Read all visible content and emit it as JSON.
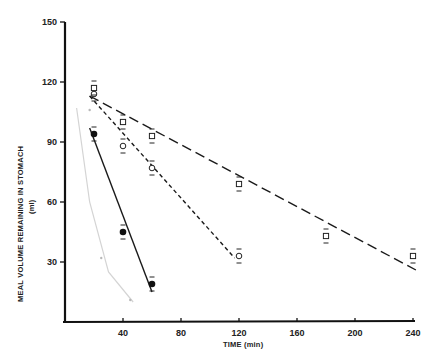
{
  "chart_data": {
    "type": "scatter",
    "title": "",
    "xlabel": "TIME (min)",
    "ylabel": "MEAL VOLUME REMAINING IN STOMACH",
    "ylabel_unit": "(ml)",
    "xlim": [
      0,
      240
    ],
    "ylim": [
      0,
      150
    ],
    "x_ticks": [
      40,
      80,
      120,
      160,
      200,
      240
    ],
    "y_ticks": [
      30,
      60,
      90,
      120,
      150
    ],
    "grid": false,
    "legend": null,
    "series": [
      {
        "name": "filled-circles",
        "marker": "filled-circle",
        "line_style": "solid",
        "points": [
          {
            "x": 20,
            "y": 94
          },
          {
            "x": 40,
            "y": 45
          },
          {
            "x": 60,
            "y": 19
          }
        ],
        "fit_line": [
          {
            "x": 17,
            "y": 97
          },
          {
            "x": 60,
            "y": 15
          }
        ]
      },
      {
        "name": "open-circles",
        "marker": "open-circle",
        "line_style": "short-dash",
        "points": [
          {
            "x": 20,
            "y": 114
          },
          {
            "x": 40,
            "y": 88
          },
          {
            "x": 60,
            "y": 77
          },
          {
            "x": 120,
            "y": 33
          }
        ],
        "fit_line": [
          {
            "x": 17,
            "y": 113
          },
          {
            "x": 117,
            "y": 32
          }
        ]
      },
      {
        "name": "open-squares",
        "marker": "open-square",
        "line_style": "long-dash",
        "points": [
          {
            "x": 20,
            "y": 117
          },
          {
            "x": 40,
            "y": 100
          },
          {
            "x": 60,
            "y": 93
          },
          {
            "x": 120,
            "y": 69
          },
          {
            "x": 180,
            "y": 43
          },
          {
            "x": 240,
            "y": 33
          }
        ],
        "fit_line": [
          {
            "x": 17,
            "y": 113
          },
          {
            "x": 242,
            "y": 26
          }
        ]
      },
      {
        "name": "faint-gray-curve",
        "marker": "small-dot",
        "line_style": "faint-curve",
        "points": [
          {
            "x": 17,
            "y": 106
          },
          {
            "x": 25,
            "y": 32
          },
          {
            "x": 45,
            "y": 11
          }
        ],
        "fit_line": [
          {
            "x": 8,
            "y": 107
          },
          {
            "x": 17,
            "y": 60
          },
          {
            "x": 30,
            "y": 25
          },
          {
            "x": 47,
            "y": 10
          }
        ]
      }
    ]
  },
  "axes": {
    "x_label": "TIME (min)",
    "y_label": "MEAL VOLUME REMAINING IN STOMACH",
    "y_unit": "(ml)",
    "x_ticks": [
      "40",
      "80",
      "120",
      "160",
      "200",
      "240"
    ],
    "y_ticks": [
      "30",
      "60",
      "90",
      "120",
      "150"
    ]
  }
}
